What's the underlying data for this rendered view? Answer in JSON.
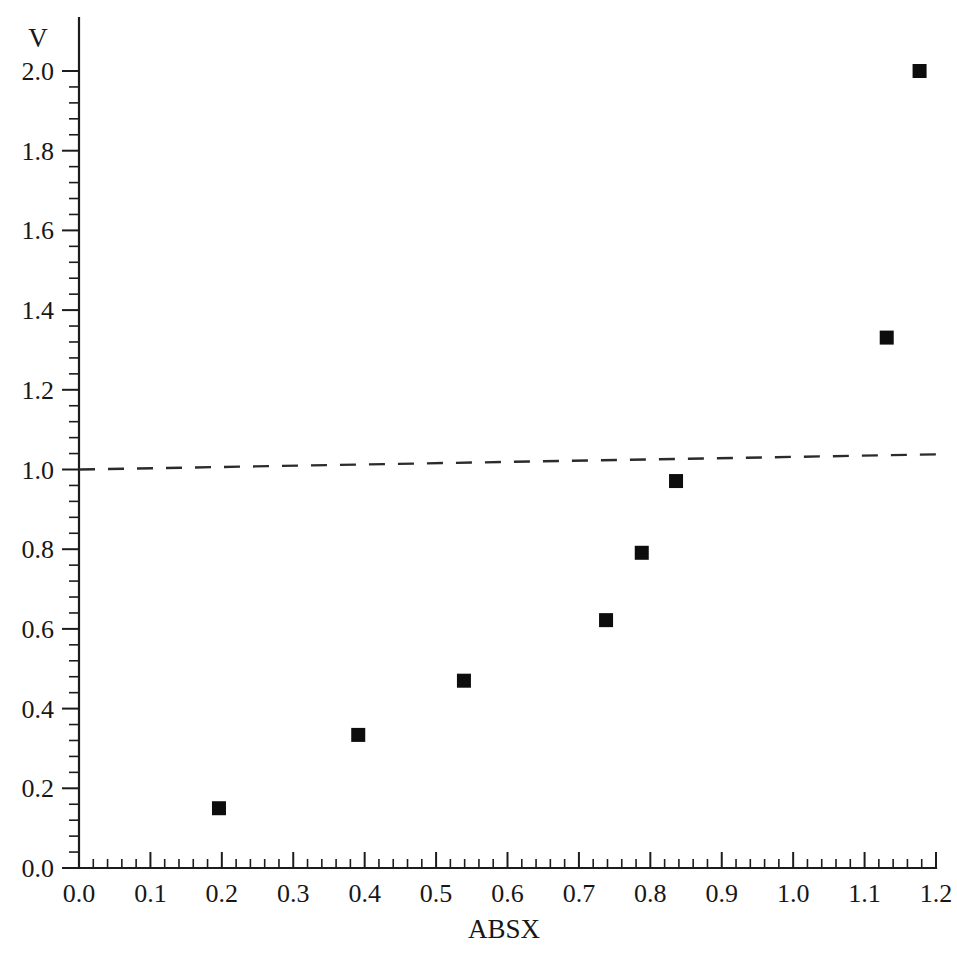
{
  "chart_data": {
    "type": "scatter",
    "title": "",
    "xlabel": "ABSX",
    "ylabel": "V",
    "xlim": [
      0.0,
      1.2
    ],
    "ylim": [
      0.0,
      2.0
    ],
    "grid": false,
    "legend": null,
    "x_ticks": [
      "0.0",
      "0.1",
      "0.2",
      "0.3",
      "0.4",
      "0.5",
      "0.6",
      "0.7",
      "0.8",
      "0.9",
      "1.0",
      "1.1",
      "1.2"
    ],
    "x_tick_values": [
      0.0,
      0.1,
      0.2,
      0.3,
      0.4,
      0.5,
      0.6,
      0.7,
      0.8,
      0.9,
      1.0,
      1.1,
      1.2
    ],
    "y_ticks": [
      "0.0",
      "0.2",
      "0.4",
      "0.6",
      "0.8",
      "1.0",
      "1.2",
      "1.4",
      "1.6",
      "1.8",
      "2.0"
    ],
    "y_tick_values": [
      0.0,
      0.2,
      0.4,
      0.6,
      0.8,
      1.0,
      1.2,
      1.4,
      1.6,
      1.8,
      2.0
    ],
    "x_minor_per_major": 5,
    "y_minor_per_major": 5,
    "series": [
      {
        "name": "data",
        "marker": "filled-square",
        "marker_color": "#0d0d0d",
        "points": [
          {
            "x": 0.196,
            "y": 0.15
          },
          {
            "x": 0.391,
            "y": 0.334
          },
          {
            "x": 0.539,
            "y": 0.47
          },
          {
            "x": 0.738,
            "y": 0.622
          },
          {
            "x": 0.788,
            "y": 0.791
          },
          {
            "x": 0.836,
            "y": 0.971
          },
          {
            "x": 1.131,
            "y": 1.331
          },
          {
            "x": 1.177,
            "y": 2.0
          }
        ]
      }
    ],
    "reference_line": {
      "name": "reference",
      "style": "dashed",
      "color": "#2b2b2b",
      "x_start": 0.0,
      "y_start": 1.0,
      "x_end": 1.2,
      "y_end": 1.038
    }
  }
}
